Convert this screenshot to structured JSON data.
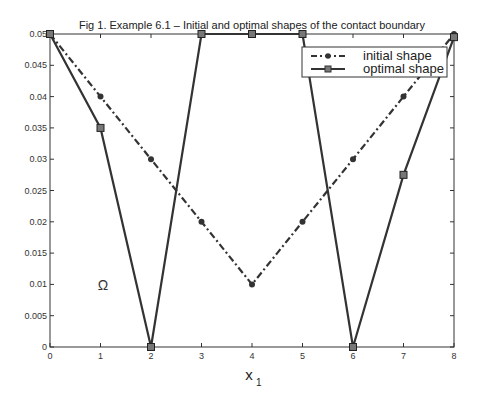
{
  "chart_data": {
    "type": "line",
    "title": "Fig 1. Example 6.1 – Initial and optimal shapes of the contact boundary",
    "xlabel": "x",
    "xlabel_subscript": "1",
    "ylabel": "",
    "x": [
      0,
      1,
      2,
      3,
      4,
      5,
      6,
      7,
      8
    ],
    "xlim": [
      0,
      8
    ],
    "ylim": [
      0,
      0.05
    ],
    "xticks": [
      "0",
      "1",
      "2",
      "3",
      "4",
      "5",
      "6",
      "7",
      "8"
    ],
    "yticks": [
      "0",
      "0.005",
      "0.01",
      "0.015",
      "0.02",
      "0.025",
      "0.03",
      "0.035",
      "0.04",
      "0.045",
      "0.05"
    ],
    "grid": false,
    "legend_position": "upper right",
    "annotation": "Ω",
    "series": [
      {
        "name": "initial shape",
        "style": "dash-dot",
        "marker": "circle",
        "values": [
          0.05,
          0.04,
          0.03,
          0.02,
          0.01,
          0.02,
          0.03,
          0.04,
          0.05
        ]
      },
      {
        "name": "optimal shape",
        "style": "solid",
        "marker": "square",
        "values": [
          0.05,
          0.035,
          0.0,
          0.05,
          0.05,
          0.05,
          0.0,
          0.0275,
          0.0495
        ]
      }
    ]
  },
  "labels": {
    "title": "Fig 1. Example 6.1 – Initial and optimal shapes of the contact boundary",
    "xlabel": "x",
    "xsub": "1",
    "omega": "Ω",
    "legend_initial": "initial shape",
    "legend_optimal": "optimal shape"
  }
}
